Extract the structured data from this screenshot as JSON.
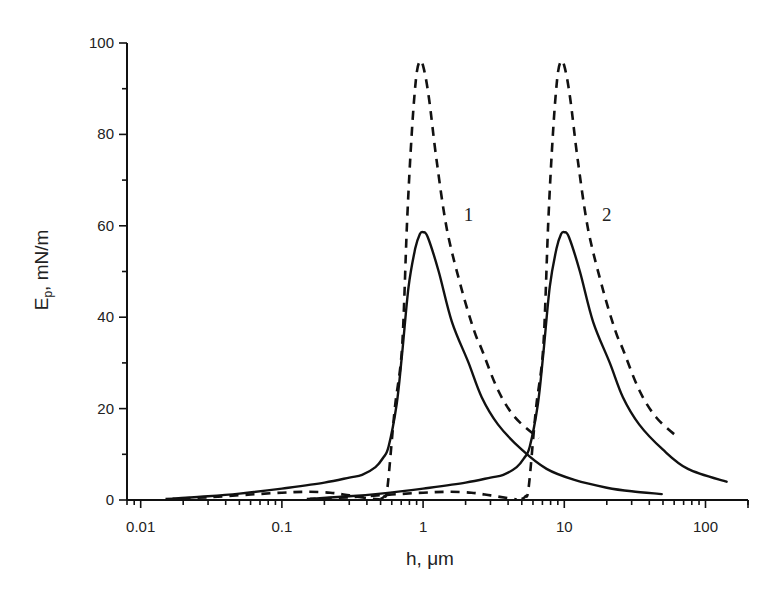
{
  "chart_data": {
    "type": "line",
    "title": "",
    "xlabel": "h, μm",
    "ylabel": "E",
    "ylabel_subscript": "p",
    "ylabel_units": ", mN/m",
    "xscale": "log",
    "xlim": [
      0.008,
      200
    ],
    "ylim": [
      0,
      100
    ],
    "grid": false,
    "x_ticks": [
      {
        "value": 0.01,
        "label": "0.01"
      },
      {
        "value": 0.1,
        "label": "0.1"
      },
      {
        "value": 1,
        "label": "1"
      },
      {
        "value": 10,
        "label": "10"
      },
      {
        "value": 100,
        "label": "100"
      }
    ],
    "y_ticks": [
      {
        "value": 0,
        "label": "0"
      },
      {
        "value": 20,
        "label": "20"
      },
      {
        "value": 40,
        "label": "40"
      },
      {
        "value": 60,
        "label": "60"
      },
      {
        "value": 80,
        "label": "80"
      },
      {
        "value": 100,
        "label": "100"
      }
    ],
    "y_minor_ticks": [
      10,
      30,
      50,
      70,
      90
    ],
    "annotations": [
      {
        "text": "1",
        "x": 2.1,
        "y": 61
      },
      {
        "text": "2",
        "x": 20,
        "y": 61
      }
    ],
    "series": [
      {
        "name": "1 (solid)",
        "style": "solid",
        "points": [
          [
            0.017,
            0.3
          ],
          [
            0.03,
            0.8
          ],
          [
            0.05,
            1.4
          ],
          [
            0.1,
            2.5
          ],
          [
            0.2,
            3.8
          ],
          [
            0.3,
            4.9
          ],
          [
            0.37,
            5.5
          ],
          [
            0.46,
            7.2
          ],
          [
            0.52,
            9.2
          ],
          [
            0.57,
            11.7
          ],
          [
            0.65,
            21
          ],
          [
            0.71,
            32
          ],
          [
            0.79,
            46.7
          ],
          [
            0.88,
            55
          ],
          [
            0.95,
            58.2
          ],
          [
            1.0,
            58.6
          ],
          [
            1.08,
            57.5
          ],
          [
            1.29,
            50
          ],
          [
            1.6,
            39
          ],
          [
            2.1,
            30
          ],
          [
            2.6,
            22.5
          ],
          [
            3.4,
            16.5
          ],
          [
            5.0,
            11
          ],
          [
            7.5,
            6.8
          ],
          [
            11.8,
            4.4
          ],
          [
            20,
            2.7
          ],
          [
            30,
            1.9
          ],
          [
            49,
            1.3
          ]
        ]
      },
      {
        "name": "1 (dashed)",
        "style": "dashed",
        "points": [
          [
            0.5,
            0.2
          ],
          [
            0.53,
            0.8
          ],
          [
            0.56,
            2.8
          ],
          [
            0.63,
            20
          ],
          [
            0.71,
            33.5
          ],
          [
            0.77,
            61
          ],
          [
            0.83,
            80
          ],
          [
            0.89,
            92
          ],
          [
            0.94,
            95.8
          ],
          [
            1.0,
            95
          ],
          [
            1.1,
            88
          ],
          [
            1.25,
            74
          ],
          [
            1.48,
            59
          ],
          [
            1.88,
            46
          ],
          [
            2.3,
            37
          ],
          [
            2.6,
            33
          ],
          [
            3.4,
            24
          ],
          [
            4.5,
            18
          ],
          [
            6.6,
            13.5
          ]
        ]
      },
      {
        "name": "1 (dashed, lower branch)",
        "style": "dashed",
        "points": [
          [
            0.015,
            0.2
          ],
          [
            0.03,
            0.6
          ],
          [
            0.06,
            1.2
          ],
          [
            0.1,
            1.6
          ],
          [
            0.15,
            1.8
          ],
          [
            0.22,
            1.6
          ],
          [
            0.3,
            1.0
          ],
          [
            0.4,
            0.4
          ],
          [
            0.5,
            0.1
          ]
        ]
      },
      {
        "name": "2 (solid)",
        "style": "solid",
        "points": [
          [
            0.16,
            0.3
          ],
          [
            0.3,
            0.8
          ],
          [
            0.5,
            1.4
          ],
          [
            1.0,
            2.5
          ],
          [
            2.0,
            3.8
          ],
          [
            3.0,
            4.9
          ],
          [
            3.7,
            5.5
          ],
          [
            4.6,
            7.2
          ],
          [
            5.2,
            9.2
          ],
          [
            5.7,
            11.7
          ],
          [
            6.5,
            21
          ],
          [
            7.1,
            32
          ],
          [
            7.9,
            46.7
          ],
          [
            8.8,
            55
          ],
          [
            9.5,
            58.2
          ],
          [
            10,
            58.6
          ],
          [
            10.8,
            57.5
          ],
          [
            12.9,
            50
          ],
          [
            16,
            39
          ],
          [
            21,
            30
          ],
          [
            26,
            22.5
          ],
          [
            34,
            16.5
          ],
          [
            50,
            11
          ],
          [
            75,
            6.8
          ],
          [
            141,
            4.0
          ]
        ]
      },
      {
        "name": "2 (dashed)",
        "style": "dashed",
        "points": [
          [
            5.0,
            0.2
          ],
          [
            5.3,
            0.8
          ],
          [
            5.6,
            2.8
          ],
          [
            6.3,
            20
          ],
          [
            7.1,
            33.5
          ],
          [
            7.7,
            61
          ],
          [
            8.3,
            80
          ],
          [
            8.9,
            92
          ],
          [
            9.4,
            95.8
          ],
          [
            10,
            95
          ],
          [
            11,
            88
          ],
          [
            12.5,
            74
          ],
          [
            14.8,
            59
          ],
          [
            18.8,
            46
          ],
          [
            23,
            37
          ],
          [
            26,
            33
          ],
          [
            34,
            24
          ],
          [
            45,
            18
          ],
          [
            65,
            13.5
          ]
        ]
      },
      {
        "name": "2 (dashed, lower branch)",
        "style": "dashed",
        "points": [
          [
            0.15,
            0.2
          ],
          [
            0.3,
            0.6
          ],
          [
            0.6,
            1.2
          ],
          [
            1.0,
            1.6
          ],
          [
            1.5,
            1.8
          ],
          [
            2.2,
            1.6
          ],
          [
            3.0,
            1.0
          ],
          [
            4.0,
            0.4
          ],
          [
            4.6,
            0.1
          ]
        ]
      }
    ]
  }
}
